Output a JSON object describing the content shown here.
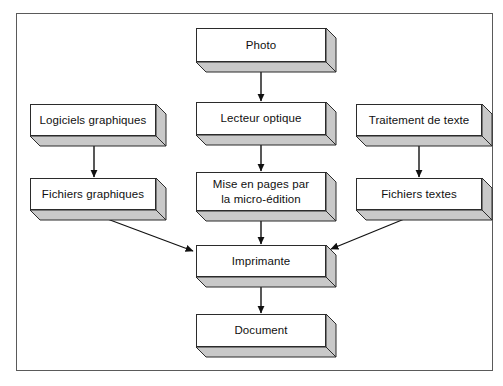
{
  "diagram": {
    "language": "fr",
    "style": {
      "frame_border_color": "#5a5a5a",
      "box_border_color": "#2b2b2b",
      "box_face_color": "#ffffff",
      "box_shade_color": "#c9c9c9",
      "box_shade_dark_color": "#a8a8a8",
      "arrow_color": "#111111",
      "background_color": "#ffffff"
    },
    "nodes": [
      {
        "id": "photo",
        "label": "Photo",
        "x": 196,
        "y": 28,
        "w": 130,
        "h": 34,
        "depth": 10
      },
      {
        "id": "logiciels-graphiques",
        "label": "Logiciels graphiques",
        "x": 30,
        "y": 104,
        "w": 126,
        "h": 32,
        "depth": 10
      },
      {
        "id": "lecteur-optique",
        "label": "Lecteur optique",
        "x": 196,
        "y": 102,
        "w": 130,
        "h": 33,
        "depth": 10
      },
      {
        "id": "traitement-de-texte",
        "label": "Traitement de texte",
        "x": 356,
        "y": 104,
        "w": 126,
        "h": 32,
        "depth": 10
      },
      {
        "id": "fichiers-graphiques",
        "label": "Fichiers graphiques",
        "x": 30,
        "y": 178,
        "w": 126,
        "h": 32,
        "depth": 10
      },
      {
        "id": "mise-en-pages",
        "label": "Mise en pages par\nla micro-édition",
        "x": 196,
        "y": 172,
        "w": 130,
        "h": 39,
        "depth": 10
      },
      {
        "id": "fichiers-textes",
        "label": "Fichiers textes",
        "x": 356,
        "y": 178,
        "w": 126,
        "h": 32,
        "depth": 10
      },
      {
        "id": "imprimante",
        "label": "Imprimante",
        "x": 196,
        "y": 245,
        "w": 130,
        "h": 32,
        "depth": 10
      },
      {
        "id": "document",
        "label": "Document",
        "x": 196,
        "y": 314,
        "w": 130,
        "h": 33,
        "depth": 10
      }
    ],
    "edges": [
      {
        "id": "photo-to-lecteur",
        "from": "photo",
        "to": "lecteur-optique",
        "kind": "vertical-arrow"
      },
      {
        "id": "logiciels-to-fichiers-graphiques",
        "from": "logiciels-graphiques",
        "to": "fichiers-graphiques",
        "kind": "vertical-arrow"
      },
      {
        "id": "lecteur-to-mise-en-pages",
        "from": "lecteur-optique",
        "to": "mise-en-pages",
        "kind": "vertical-arrow"
      },
      {
        "id": "traitement-to-fichiers-textes",
        "from": "traitement-de-texte",
        "to": "fichiers-textes",
        "kind": "vertical-arrow"
      },
      {
        "id": "fichiers-graphiques-to-imprimante",
        "from": "fichiers-graphiques",
        "to": "imprimante",
        "kind": "diagonal-arrow"
      },
      {
        "id": "mise-en-pages-to-imprimante",
        "from": "mise-en-pages",
        "to": "imprimante",
        "kind": "vertical-arrow"
      },
      {
        "id": "fichiers-textes-to-imprimante",
        "from": "fichiers-textes",
        "to": "imprimante",
        "kind": "diagonal-arrow"
      },
      {
        "id": "imprimante-to-document",
        "from": "imprimante",
        "to": "document",
        "kind": "vertical-arrow"
      }
    ]
  }
}
